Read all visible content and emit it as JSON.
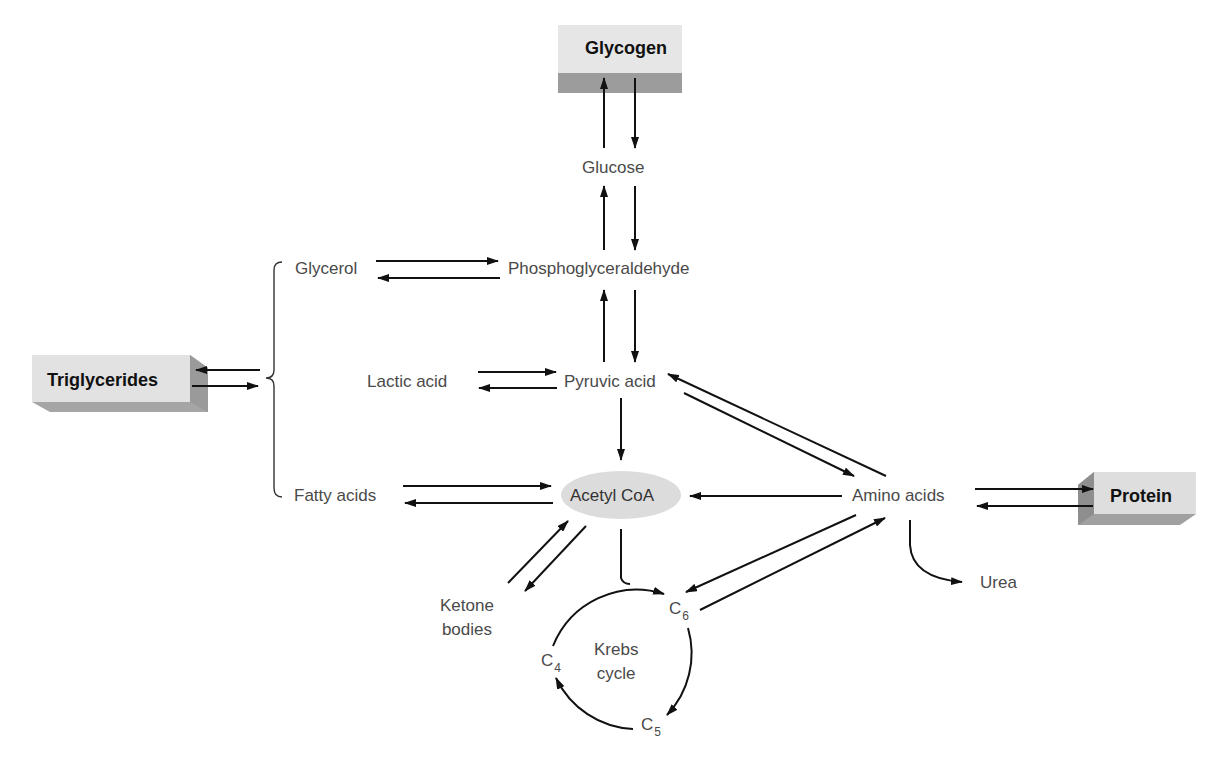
{
  "diagram": {
    "storage_boxes": {
      "glycogen": "Glycogen",
      "triglycerides": "Triglycerides",
      "protein": "Protein"
    },
    "nodes": {
      "glucose": "Glucose",
      "glycerol": "Glycerol",
      "phosphoglyceraldehyde": "Phosphoglyceraldehyde",
      "lactic_acid": "Lactic acid",
      "pyruvic_acid": "Pyruvic acid",
      "fatty_acids": "Fatty acids",
      "acetyl_coa": "Acetyl CoA",
      "amino_acids": "Amino acids",
      "urea": "Urea",
      "ketone_line1": "Ketone",
      "ketone_line2": "bodies",
      "krebs_line1": "Krebs",
      "krebs_line2": "cycle",
      "c6": "C",
      "c6_sub": "6",
      "c5": "C",
      "c5_sub": "5",
      "c4": "C",
      "c4_sub": "4"
    },
    "colors": {
      "box_face": "#e4e4e4",
      "box_shadow": "#9a9a9a",
      "acetyl_fill": "#dcdcdc",
      "arrow": "#111111",
      "label": "#4a4a4a"
    }
  }
}
